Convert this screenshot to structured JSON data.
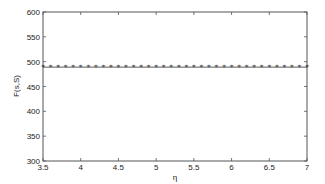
{
  "chart_data": {
    "type": "line",
    "title": "",
    "xlabel": "η",
    "ylabel": "F(s,S)",
    "xlim": [
      3.5,
      7
    ],
    "ylim": [
      300,
      600
    ],
    "xticks": [
      3.5,
      4,
      4.5,
      5,
      5.5,
      6,
      6.5,
      7
    ],
    "xtick_labels": [
      "3.5",
      "4",
      "4.5",
      "5",
      "5.5",
      "6",
      "6.5",
      "7"
    ],
    "yticks": [
      300,
      350,
      400,
      450,
      500,
      550,
      600
    ],
    "ytick_labels": [
      "300",
      "350",
      "400",
      "450",
      "500",
      "550",
      "600"
    ],
    "grid": false,
    "legend": null,
    "series": [
      {
        "name": "F(s,S)",
        "marker": "star",
        "color": "#333333",
        "x": [
          3.5,
          3.6,
          3.7,
          3.8,
          3.9,
          4.0,
          4.1,
          4.2,
          4.3,
          4.4,
          4.5,
          4.6,
          4.7,
          4.8,
          4.9,
          5.0,
          5.1,
          5.2,
          5.3,
          5.4,
          5.5,
          5.6,
          5.7,
          5.8,
          5.9,
          6.0,
          6.1,
          6.2,
          6.3,
          6.4,
          6.5,
          6.6,
          6.7,
          6.8,
          6.9,
          7.0
        ],
        "values": [
          489,
          489,
          489,
          489,
          489,
          489,
          489,
          489,
          489,
          489,
          489,
          489,
          489,
          489,
          489,
          489,
          489,
          489,
          489,
          489,
          489,
          489,
          489,
          489,
          489,
          489,
          489,
          489,
          489,
          489,
          489,
          489,
          489,
          489,
          489,
          489
        ]
      }
    ]
  },
  "colors": {
    "axis": "#555555",
    "line": "#333333",
    "background": "#ffffff"
  }
}
